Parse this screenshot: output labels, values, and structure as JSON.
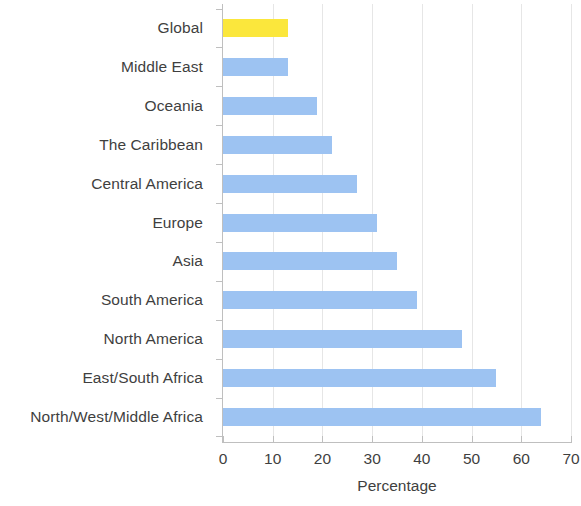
{
  "chart_data": {
    "type": "bar",
    "orientation": "horizontal",
    "title": "",
    "xlabel": "Percentage",
    "ylabel": "",
    "xlim": [
      0,
      70
    ],
    "xticks": [
      0,
      10,
      20,
      30,
      40,
      50,
      60,
      70
    ],
    "grid": "vertical",
    "legend": "none",
    "categories": [
      "Global",
      "Middle East",
      "Oceania",
      "The Caribbean",
      "Central America",
      "Europe",
      "Asia",
      "South America",
      "North America",
      "East/South Africa",
      "North/West/Middle Africa"
    ],
    "values": [
      13,
      13,
      19,
      22,
      27,
      31,
      35,
      39,
      48,
      55,
      64
    ],
    "bar_colors": [
      "#fbe73c",
      "#9dc3f2",
      "#9dc3f2",
      "#9dc3f2",
      "#9dc3f2",
      "#9dc3f2",
      "#9dc3f2",
      "#9dc3f2",
      "#9dc3f2",
      "#9dc3f2",
      "#9dc3f2"
    ],
    "highlight_color": "#fbe73c",
    "series_color": "#9dc3f2",
    "axis_color": "#bfbfbf",
    "grid_color": "#e6e6e6",
    "text_color": "#3f3f3f"
  }
}
